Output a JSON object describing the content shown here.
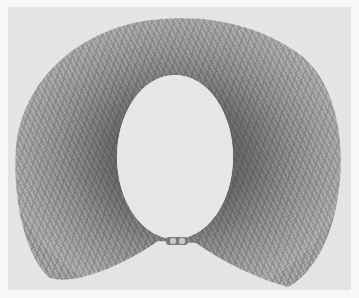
{
  "image": {
    "subject": "chainmail collar necklace",
    "description": "Black-and-white photograph of a wide mesh collar made of interlocking metal rings, shown flat with a small clasp at the bottom center opening.",
    "colors": {
      "border": "#f7f7f7",
      "background": "#e4e4e4",
      "mesh_light": "#b8b8b8",
      "mesh_mid": "#8a8a8a",
      "mesh_dark": "#5e5e5e",
      "inner_hole": "#e6e6e6"
    }
  }
}
